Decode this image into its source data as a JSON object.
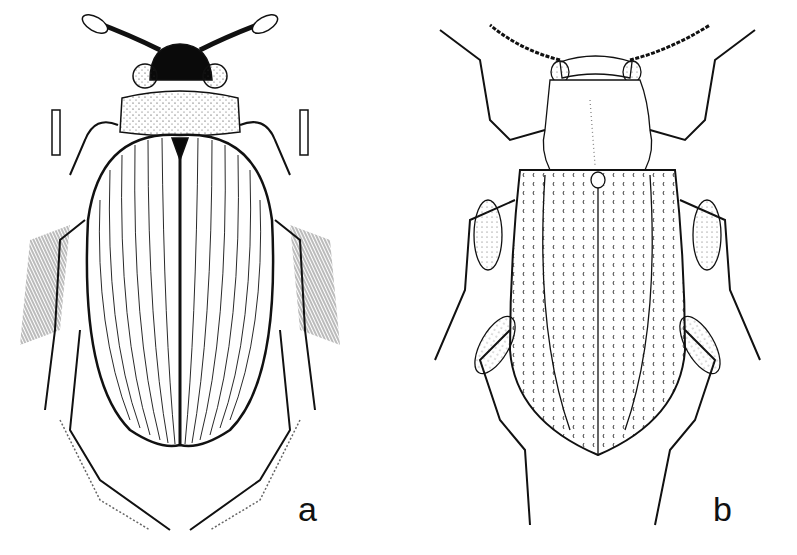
{
  "figure": {
    "panels": [
      {
        "label": "a",
        "subject": "beetle-dorsal-view-striated-elytra",
        "style": "ink-stipple-illustration",
        "head_color": "#0a0a0a"
      },
      {
        "label": "b",
        "subject": "beetle-dorsal-view-punctate-elytra",
        "style": "ink-line-illustration",
        "head_color": "#ffffff"
      }
    ],
    "background": "#ffffff",
    "ink": "#111111"
  }
}
